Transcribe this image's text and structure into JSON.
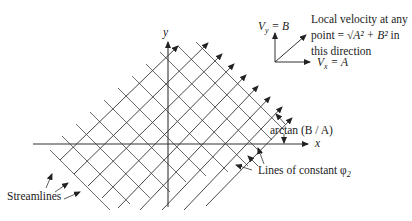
{
  "axes": {
    "x_label": "x",
    "y_label": "y"
  },
  "velocity_box": {
    "vy_label": "V",
    "vy_sub": "y",
    "vy_eq": " = B",
    "vx_label": "V",
    "vx_sub": "x",
    "vx_eq": " = A",
    "desc_line1": "Local velocity at any",
    "desc_line2_pre": "point = ",
    "desc_line2_sqrt": "√A² + B²",
    "desc_line2_post": " in",
    "desc_line3": "this direction"
  },
  "annotations": {
    "angle": "arctan (B / A)",
    "phi_lines": "Lines of constant φ",
    "phi_sub": "2",
    "streamlines": "Streamlines"
  },
  "colors": {
    "line": "#333333",
    "text": "#222222",
    "background": "#ffffff"
  }
}
